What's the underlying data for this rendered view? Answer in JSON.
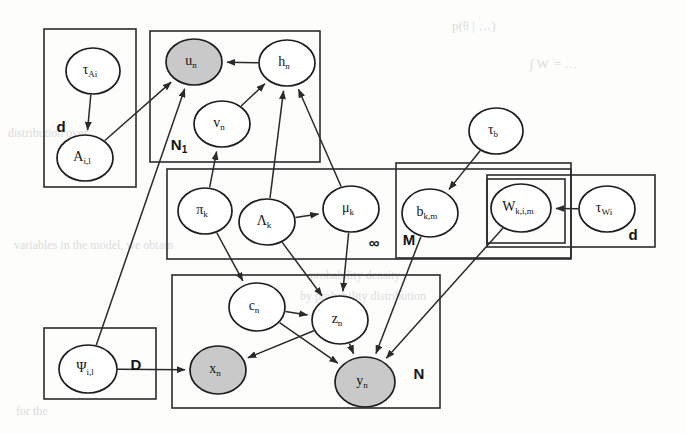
{
  "figure": {
    "type": "probabilistic-graphical-model",
    "canvas": {
      "width": 685,
      "height": 434
    },
    "colors": {
      "observed_node_fill": "#c9c9c9",
      "latent_node_fill": "#ffffff",
      "stroke": "#1d1d1d",
      "background": "#fdfdfc"
    }
  },
  "nodes": [
    {
      "id": "tau_Ai",
      "base": "τ",
      "sub": "Ai",
      "cx": 93,
      "cy": 71,
      "rx": 27,
      "ry": 23,
      "shaded": false
    },
    {
      "id": "A_il",
      "base": "A",
      "sub": "i,l",
      "cx": 85,
      "cy": 158,
      "rx": 28,
      "ry": 23,
      "shaded": false
    },
    {
      "id": "u_n",
      "base": "u",
      "sub": "n",
      "cx": 194,
      "cy": 62,
      "rx": 28,
      "ry": 23,
      "shaded": true
    },
    {
      "id": "h_n",
      "base": "h",
      "sub": "n",
      "cx": 287,
      "cy": 63,
      "rx": 28,
      "ry": 23,
      "shaded": false
    },
    {
      "id": "v_n",
      "base": "v",
      "sub": "n",
      "cx": 222,
      "cy": 124,
      "rx": 28,
      "ry": 23,
      "shaded": false
    },
    {
      "id": "pi_k",
      "base": "π",
      "sub": "k",
      "cx": 205,
      "cy": 211,
      "rx": 27,
      "ry": 23,
      "shaded": false
    },
    {
      "id": "Lambda_k",
      "base": "Λ",
      "sub": "k",
      "cx": 267,
      "cy": 222,
      "rx": 28,
      "ry": 23,
      "shaded": false
    },
    {
      "id": "mu_k",
      "base": "μ",
      "sub": "k",
      "cx": 351,
      "cy": 209,
      "rx": 28,
      "ry": 23,
      "shaded": false
    },
    {
      "id": "tau_b",
      "base": "τ",
      "sub": "b",
      "cx": 496,
      "cy": 131,
      "rx": 27,
      "ry": 23,
      "shaded": false
    },
    {
      "id": "b_km",
      "base": "b",
      "sub": "k,m",
      "cx": 430,
      "cy": 213,
      "rx": 28,
      "ry": 24,
      "shaded": false
    },
    {
      "id": "W_kim",
      "base": "W",
      "sub": "k,i,m",
      "cx": 521,
      "cy": 208,
      "rx": 30,
      "ry": 24,
      "shaded": false
    },
    {
      "id": "tau_Wi",
      "base": "τ",
      "sub": "Wi",
      "cx": 607,
      "cy": 209,
      "rx": 28,
      "ry": 23,
      "shaded": false
    },
    {
      "id": "c_n",
      "base": "c",
      "sub": "n",
      "cx": 257,
      "cy": 307,
      "rx": 28,
      "ry": 24,
      "shaded": false
    },
    {
      "id": "z_n",
      "base": "z",
      "sub": "n",
      "cx": 340,
      "cy": 320,
      "rx": 28,
      "ry": 24,
      "shaded": false
    },
    {
      "id": "psi_il",
      "base": "Ψ",
      "sub": "i,l",
      "cx": 88,
      "cy": 369,
      "rx": 29,
      "ry": 24,
      "shaded": false
    },
    {
      "id": "x_n",
      "base": "x",
      "sub": "n",
      "cx": 218,
      "cy": 370,
      "rx": 28,
      "ry": 24,
      "shaded": true
    },
    {
      "id": "y_n",
      "base": "y",
      "sub": "n",
      "cx": 365,
      "cy": 382,
      "rx": 30,
      "ry": 25,
      "shaded": true
    }
  ],
  "plates": [
    {
      "id": "plate_d_left",
      "label": "d",
      "sub": "",
      "x": 44,
      "y": 29,
      "w": 92,
      "h": 158,
      "label_x": 61,
      "label_y": 128
    },
    {
      "id": "plate_N1",
      "label": "N",
      "sub": "1",
      "x": 150,
      "y": 31,
      "w": 170,
      "h": 131,
      "label_x": 179,
      "label_y": 146
    },
    {
      "id": "plate_infty",
      "label": "∞",
      "sub": "",
      "x": 167,
      "y": 169,
      "w": 404,
      "h": 90,
      "label_x": 374,
      "label_y": 244
    },
    {
      "id": "plate_M",
      "label": "M",
      "sub": "",
      "x": 396,
      "y": 163,
      "w": 175,
      "h": 95,
      "label_x": 409,
      "label_y": 241
    },
    {
      "id": "plate_d_right",
      "label": "d",
      "sub": "",
      "x": 487,
      "y": 175,
      "w": 168,
      "h": 72,
      "label_x": 633,
      "label_y": 236
    },
    {
      "id": "plate_W",
      "label": "",
      "sub": "",
      "x": 487,
      "y": 179,
      "w": 78,
      "h": 64,
      "label_x": 0,
      "label_y": 0
    },
    {
      "id": "plate_D",
      "label": "D",
      "sub": "",
      "x": 44,
      "y": 328,
      "w": 112,
      "h": 71,
      "label_x": 136,
      "label_y": 366
    },
    {
      "id": "plate_N",
      "label": "N",
      "sub": "",
      "x": 172,
      "y": 275,
      "w": 268,
      "h": 133,
      "label_x": 419,
      "label_y": 375
    }
  ],
  "edges": [
    {
      "from": "tau_Ai",
      "to": "A_il"
    },
    {
      "from": "A_il",
      "to": "u_n"
    },
    {
      "from": "psi_il",
      "to": "u_n"
    },
    {
      "from": "h_n",
      "to": "u_n"
    },
    {
      "from": "v_n",
      "to": "h_n"
    },
    {
      "from": "mu_k",
      "to": "h_n"
    },
    {
      "from": "Lambda_k",
      "to": "h_n"
    },
    {
      "from": "pi_k",
      "to": "v_n"
    },
    {
      "from": "Lambda_k",
      "to": "mu_k"
    },
    {
      "from": "pi_k",
      "to": "c_n"
    },
    {
      "from": "Lambda_k",
      "to": "z_n"
    },
    {
      "from": "mu_k",
      "to": "z_n"
    },
    {
      "from": "c_n",
      "to": "z_n"
    },
    {
      "from": "c_n",
      "to": "y_n"
    },
    {
      "from": "z_n",
      "to": "x_n"
    },
    {
      "from": "z_n",
      "to": "y_n"
    },
    {
      "from": "psi_il",
      "to": "x_n"
    },
    {
      "from": "tau_b",
      "to": "b_km"
    },
    {
      "from": "tau_Wi",
      "to": "W_kim"
    },
    {
      "from": "b_km",
      "to": "y_n"
    },
    {
      "from": "W_kim",
      "to": "y_n"
    }
  ],
  "background_text": [
    {
      "text": "p(θ | …)",
      "x": 452,
      "y": 18,
      "size": 13
    },
    {
      "text": "∫ W  = …",
      "x": 530,
      "y": 56,
      "size": 13
    },
    {
      "text": "distribution over",
      "x": 8,
      "y": 126,
      "size": 12
    },
    {
      "text": "probability density",
      "x": 310,
      "y": 268,
      "size": 12
    },
    {
      "text": "variables in the model, we obtain",
      "x": 14,
      "y": 238,
      "size": 12
    },
    {
      "text": "by probability distribution",
      "x": 300,
      "y": 289,
      "size": 12
    },
    {
      "text": "for the",
      "x": 16,
      "y": 404,
      "size": 12
    }
  ]
}
